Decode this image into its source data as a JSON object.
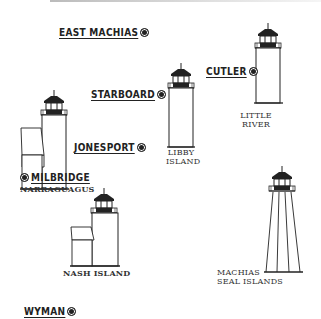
{
  "locations": {
    "east_machias": "EAST MACHIAS",
    "starboard": "STARBOARD",
    "cutler": "CUTLER",
    "jonesport": "JONESPORT",
    "milbridge": "MILBRIDGE",
    "wyman": "WYMAN"
  },
  "lighthouses": {
    "narraguagus": "NARRAGUAGUS",
    "libby_island_1": "LIBBY",
    "libby_island_2": "ISLAND",
    "little_river_1": "LITTLE",
    "little_river_2": "RIVER",
    "nash_island": "NASH ISLAND",
    "machias_seal_1": "MACHIAS",
    "machias_seal_2": "SEAL ISLANDS"
  },
  "icons": {
    "town_marker": "bullseye-dot"
  },
  "colors": {
    "ink": "#222222",
    "background": "#ffffff"
  }
}
